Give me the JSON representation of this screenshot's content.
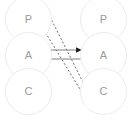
{
  "diagram": {
    "title": "",
    "canvas": {
      "width": 131,
      "height": 120,
      "background": "#ffffff"
    },
    "colors": {
      "circle_stroke": "#ececed",
      "circle_fill": "#ffffff",
      "label_text": "#9a9a9c",
      "solid_edge": "#808080",
      "dashed_edge": "#6e6e6e",
      "arrowhead": "#1a1a1a"
    },
    "nodes": {
      "left_column": [
        {
          "id": "left-p",
          "label": "P",
          "cx": 28,
          "cy": 19
        },
        {
          "id": "left-a",
          "label": "A",
          "cx": 28,
          "cy": 55
        },
        {
          "id": "left-c",
          "label": "C",
          "cx": 28,
          "cy": 91
        }
      ],
      "right_column": [
        {
          "id": "right-p",
          "label": "P",
          "cx": 104,
          "cy": 19
        },
        {
          "id": "right-a",
          "label": "A",
          "cx": 104,
          "cy": 55
        },
        {
          "id": "right-c",
          "label": "C",
          "cx": 104,
          "cy": 91
        }
      ]
    },
    "edges": [
      {
        "id": "edge-a-to-a-right",
        "style": "solid",
        "label": "",
        "from": "left-a",
        "to": "right-a",
        "x1": 41,
        "y1": 50,
        "x2": 81,
        "y2": 50,
        "arrow_at": "end"
      },
      {
        "id": "edge-a-to-a-left",
        "style": "solid",
        "label": "",
        "from": "right-a",
        "to": "left-a",
        "x1": 88,
        "y1": 59,
        "x2": 44,
        "y2": 59,
        "arrow_at": "end"
      },
      {
        "id": "edge-p-left-to-c-right",
        "style": "dashed",
        "label": "",
        "from": "left-p",
        "to": "right-c",
        "x1": 48,
        "y1": 13,
        "x2": 90,
        "y2": 96,
        "arrow_at": "end"
      },
      {
        "id": "edge-c-right-to-p-left",
        "style": "dashed",
        "label": "",
        "from": "right-c",
        "to": "left-p",
        "x1": 86,
        "y1": 99,
        "x2": 42,
        "y2": 27,
        "arrow_at": "end"
      }
    ]
  }
}
